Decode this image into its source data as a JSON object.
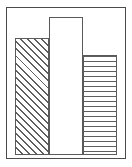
{
  "chart_data": {
    "type": "bar",
    "title": "",
    "subtitle": "",
    "xlabel": "",
    "ylabel": "",
    "categories": [
      "1",
      "2",
      "3"
    ],
    "values": [
      119,
      141,
      101
    ],
    "ylim": [
      0,
      150
    ],
    "grid": false,
    "legend": false,
    "legend_position": "none",
    "axis_ticks": {
      "x": [],
      "y": []
    },
    "annotations": [],
    "series": [
      {
        "name": "",
        "values": [
          119,
          141,
          101
        ],
        "fills": [
          "diagonal-hatch",
          "none",
          "horizontal-lines"
        ]
      }
    ],
    "bars": [
      {
        "category": "1",
        "value": 119,
        "fill_pattern": "diagonal-hatch",
        "fill_color": "#ffffff",
        "pattern_color": "#5f5f5f",
        "border_color": "#5a5a5a"
      },
      {
        "category": "2",
        "value": 141,
        "fill_pattern": "none",
        "fill_color": "#ffffff",
        "pattern_color": "#ffffff",
        "border_color": "#5a5a5a"
      },
      {
        "category": "3",
        "value": 101,
        "fill_pattern": "horizontal-lines",
        "fill_color": "#ffffff",
        "pattern_color": "#5f5f5f",
        "border_color": "#5a5a5a"
      }
    ]
  },
  "frame": {
    "border_color": "#4a4a4a",
    "background_color": "#ffffff"
  }
}
